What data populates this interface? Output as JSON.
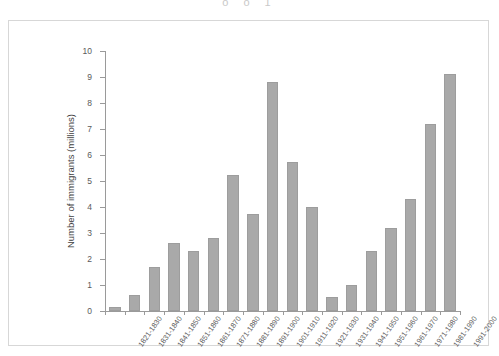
{
  "figure": {
    "top_cropped_text": "o o      1"
  },
  "chart_data": {
    "type": "bar",
    "title": "",
    "xlabel": "",
    "ylabel": "Number of immigrants (millions)",
    "ylim": [
      0,
      10
    ],
    "yticks": [
      0,
      1,
      2,
      3,
      4,
      5,
      6,
      7,
      8,
      9,
      10
    ],
    "ytick_labels": [
      "0",
      "1",
      "2",
      "3",
      "4",
      "5",
      "6",
      "7",
      "8",
      "9",
      "10"
    ],
    "grid": false,
    "legend": null,
    "bar_color": "#a9a9a9",
    "categories": [
      "1821-1830",
      "1831-1840",
      "1841-1850",
      "1851-1860",
      "1861-1870",
      "1871-1880",
      "1881-1890",
      "1891-1900",
      "1901-1910",
      "1911-1920",
      "1921-1930",
      "1931-1940",
      "1941-1950",
      "1951-1960",
      "1961-1970",
      "1971-1980",
      "1981-1990",
      "1991-2000"
    ],
    "values": [
      0.15,
      0.6,
      1.7,
      2.6,
      2.3,
      2.8,
      5.25,
      3.75,
      8.8,
      5.75,
      4.0,
      0.55,
      1.0,
      2.3,
      3.2,
      4.3,
      7.2,
      9.1
    ]
  }
}
